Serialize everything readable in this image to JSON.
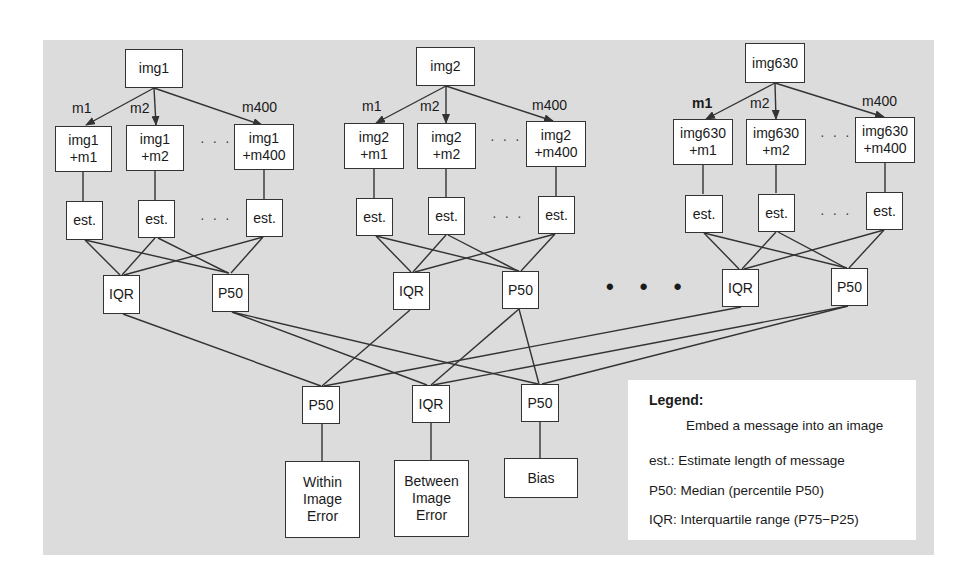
{
  "diagram": {
    "images": [
      {
        "id": "img1",
        "label": "img1",
        "edges": [
          "m1",
          "m2",
          "m400"
        ],
        "embedded": [
          {
            "line1": "img1",
            "line2": "+m1"
          },
          {
            "line1": "img1",
            "line2": "+m2"
          },
          {
            "line1": "img1",
            "line2": "+m400"
          }
        ],
        "est": [
          "est.",
          "est.",
          "est."
        ],
        "stats": [
          "IQR",
          "P50"
        ]
      },
      {
        "id": "img2",
        "label": "img2",
        "edges": [
          "m1",
          "m2",
          "m400"
        ],
        "embedded": [
          {
            "line1": "img2",
            "line2": "+m1"
          },
          {
            "line1": "img2",
            "line2": "+m2"
          },
          {
            "line1": "img2",
            "line2": "+m400"
          }
        ],
        "est": [
          "est.",
          "est.",
          "est."
        ],
        "stats": [
          "IQR",
          "P50"
        ]
      },
      {
        "id": "img630",
        "label": "img630",
        "edges": [
          "m1",
          "m2",
          "m400"
        ],
        "embedded": [
          {
            "line1": "img630",
            "line2": "+m1"
          },
          {
            "line1": "img630",
            "line2": "+m2"
          },
          {
            "line1": "img630",
            "line2": "+m400"
          }
        ],
        "est": [
          "est.",
          "est.",
          "est."
        ],
        "stats": [
          "IQR",
          "P50"
        ]
      }
    ],
    "ellipsis_small": "· · ·",
    "ellipsis_large": "• • •",
    "aggregates": [
      {
        "label": "P50",
        "output": [
          "Within",
          "Image",
          "Error"
        ]
      },
      {
        "label": "IQR",
        "output": [
          "Between",
          "Image",
          "Error"
        ]
      },
      {
        "label": "P50",
        "output": [
          "Bias"
        ]
      }
    ],
    "line_color": "#333333",
    "panel_color": "#dcdcdc"
  },
  "legend": {
    "title": "Legend:",
    "items": [
      {
        "symbol": "arrow",
        "text": "Embed a message into an image"
      },
      {
        "symbol": "est.:",
        "text": "Estimate length of message"
      },
      {
        "symbol": "P50:",
        "text": "Median (percentile P50)"
      },
      {
        "symbol": "IQR:",
        "text": "Interquartile range (P75−P25)"
      }
    ]
  }
}
